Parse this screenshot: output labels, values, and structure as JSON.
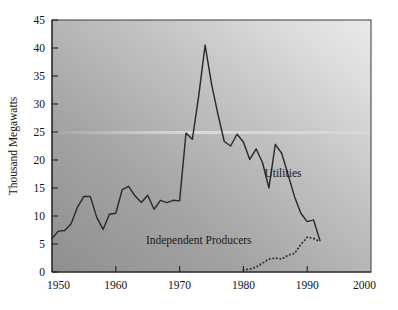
{
  "chart_data": {
    "type": "line",
    "title": "",
    "xlabel": "",
    "ylabel": "Thousand Megawatts",
    "xlim": [
      1950,
      2000
    ],
    "ylim": [
      0,
      45
    ],
    "grid": false,
    "legend_position": "inline-annotation",
    "x_ticks": [
      1950,
      1960,
      1970,
      1980,
      1990,
      2000
    ],
    "x_tick_labels": [
      "1950",
      "1960",
      "1970",
      "1980",
      "1990",
      "2000"
    ],
    "y_ticks": [
      0,
      5,
      10,
      15,
      20,
      25,
      30,
      35,
      40,
      45
    ],
    "y_tick_labels": [
      "0",
      "5",
      "10",
      "15",
      "20",
      "25",
      "30",
      "35",
      "40",
      "45"
    ],
    "series": [
      {
        "name": "Utilities",
        "style": "solid",
        "x": [
          1950,
          1951,
          1952,
          1953,
          1954,
          1955,
          1956,
          1957,
          1958,
          1959,
          1960,
          1961,
          1962,
          1963,
          1964,
          1965,
          1966,
          1967,
          1968,
          1969,
          1970,
          1971,
          1972,
          1973,
          1974,
          1975,
          1976,
          1977,
          1978,
          1979,
          1980,
          1981,
          1982,
          1983,
          1984,
          1985,
          1986,
          1987,
          1988,
          1989,
          1990,
          1991,
          1992
        ],
        "values": [
          6.0,
          7.3,
          7.4,
          8.6,
          11.6,
          13.5,
          13.5,
          9.8,
          7.6,
          10.3,
          10.5,
          14.7,
          15.3,
          13.6,
          12.4,
          13.7,
          11.2,
          12.8,
          12.4,
          12.8,
          12.7,
          24.8,
          23.7,
          31.5,
          40.5,
          33.6,
          28.2,
          23.3,
          22.5,
          24.6,
          23.2,
          20.1,
          22.0,
          19.5,
          15.0,
          22.8,
          21.2,
          17.4,
          13.5,
          10.5,
          9.0,
          9.3,
          5.6
        ]
      },
      {
        "name": "Independent Producers",
        "style": "dotted",
        "x": [
          1980,
          1981,
          1982,
          1983,
          1984,
          1985,
          1986,
          1987,
          1988,
          1989,
          1990,
          1991,
          1992
        ],
        "values": [
          0.4,
          0.5,
          0.9,
          1.6,
          2.3,
          2.5,
          2.3,
          3.0,
          3.3,
          4.9,
          6.2,
          6.0,
          5.4
        ]
      }
    ],
    "annotations": [
      {
        "text": "Utilities",
        "x": 1986.2,
        "y": 17.0
      },
      {
        "text": "Independent Producers",
        "x": 1973.0,
        "y": 5.0
      }
    ]
  },
  "figure": {
    "background_color": "#ffffff",
    "plot_fill_top_right": "#e8e8e8",
    "plot_fill_bottom_left": "#9a9a9a",
    "line_color": "#2b2b2b",
    "axis_color": "#222222",
    "text_color": "#111111"
  }
}
